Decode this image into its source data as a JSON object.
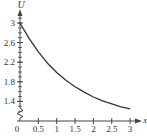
{
  "chart_data": {
    "type": "line",
    "title": "",
    "xlabel": "x",
    "ylabel": "U",
    "xlim": [
      0,
      3.2
    ],
    "ylim_visible": [
      1.2,
      3.2
    ],
    "axis_break_on_y": true,
    "grid": false,
    "legend": null,
    "x_ticks": [
      0,
      0.5,
      1,
      1.5,
      2,
      2.5,
      3
    ],
    "x_tick_labels": [
      "0",
      "0.5",
      "1",
      "1.5",
      "2",
      "2.5",
      "3"
    ],
    "y_ticks": [
      3,
      2.6,
      2.2,
      1.8,
      1.4
    ],
    "y_tick_labels": [
      "3",
      "2.6",
      "2.2",
      "1.8",
      "1.4"
    ],
    "y_minor_step": 0.1,
    "series": [
      {
        "name": "U(x)",
        "x": [
          0,
          0.25,
          0.5,
          0.75,
          1,
          1.25,
          1.5,
          1.75,
          2,
          2.25,
          2.5,
          2.75,
          3
        ],
        "values": [
          3.0,
          2.68,
          2.41,
          2.18,
          1.99,
          1.83,
          1.7,
          1.59,
          1.49,
          1.41,
          1.35,
          1.29,
          1.25
        ]
      }
    ]
  },
  "axes": {
    "x_label": "x",
    "y_label": "U",
    "origin_label": "0"
  },
  "colors": {
    "axis": "#444444",
    "curve": "#333333",
    "text": "#333333"
  }
}
